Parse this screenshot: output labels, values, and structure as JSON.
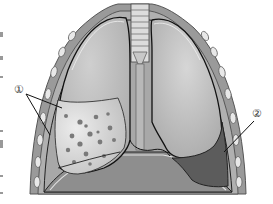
{
  "diagram": {
    "labels": [
      {
        "id": "1",
        "text": "①",
        "x": 16,
        "y": 88
      },
      {
        "id": "2",
        "text": "②",
        "x": 254,
        "y": 110
      }
    ],
    "colors": {
      "background": "#ffffff",
      "chest_wall": "#9a9a9a",
      "rib": "#e6e6e6",
      "lung": "#b4b4b4",
      "lung_highlight": "#d2d2d2",
      "affected_region": "#d8d8d8",
      "spots": "#7a7a7a",
      "effusion": "#5c5c5c",
      "outline": "#2a2a2a",
      "diaphragm": "#8c8c8c"
    }
  }
}
